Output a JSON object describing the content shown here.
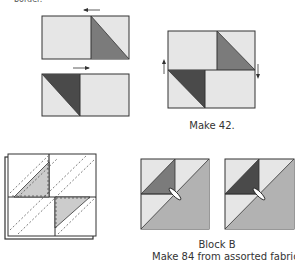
{
  "header": {
    "partial_text": "border."
  },
  "colors": {
    "light": "#e6e6e6",
    "medium": "#7b7b7b",
    "dark": "#4a4a4a",
    "blockb_big": "#b2b2b2",
    "line": "#333333"
  },
  "unit_top": {
    "arrow": "left"
  },
  "unit_bottom": {
    "arrow": "right"
  },
  "assembled_unit": {
    "caption": "Make 42.",
    "arrow_left": "up",
    "arrow_right": "down"
  },
  "sew_diagram": {
    "description": "Layered block with diagonal stitching lines"
  },
  "block_b": {
    "title": "Block B",
    "caption": "Make 84 from assorted fabrics.",
    "variants": [
      {
        "small_triangle": "medium"
      },
      {
        "small_triangle": "dark"
      }
    ]
  }
}
